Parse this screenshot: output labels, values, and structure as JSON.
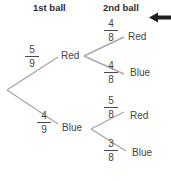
{
  "headers": [
    {
      "label": "1st ball"
    },
    {
      "label": "2nd ball"
    }
  ],
  "tree": {
    "first": [
      {
        "num": "5",
        "den": "9",
        "outcome": "Red"
      },
      {
        "num": "4",
        "den": "9",
        "outcome": "Blue"
      }
    ],
    "second": [
      {
        "num": "4",
        "den": "8",
        "outcome": "Red"
      },
      {
        "num": "4",
        "den": "8",
        "outcome": "Blue"
      },
      {
        "num": "5",
        "den": "8",
        "outcome": "Red"
      },
      {
        "num": "3",
        "den": "8",
        "outcome": "Blue"
      }
    ]
  },
  "icons": {
    "arrow": "left-arrow"
  },
  "colors": {
    "line": "#a8a8a8",
    "text": "#454545",
    "heading": "#2e2e2e",
    "arrow": "#1f1f1f",
    "background": "#ffffff"
  }
}
